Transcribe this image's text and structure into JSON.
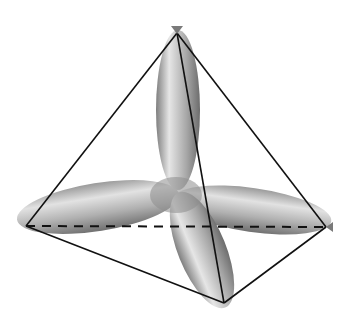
{
  "diagram": {
    "width": 338,
    "height": 325,
    "background": "#ffffff",
    "center": [
      178,
      192
    ],
    "vertices": {
      "top": [
        177,
        33
      ],
      "left": [
        26,
        226
      ],
      "right": [
        326,
        227
      ],
      "bottom": [
        224,
        303
      ]
    },
    "edges": [
      {
        "from": "top",
        "to": "left",
        "style": "solid"
      },
      {
        "from": "top",
        "to": "right",
        "style": "solid"
      },
      {
        "from": "top",
        "to": "bottom",
        "style": "solid"
      },
      {
        "from": "left",
        "to": "bottom",
        "style": "solid"
      },
      {
        "from": "right",
        "to": "bottom",
        "style": "solid"
      },
      {
        "from": "left",
        "to": "right",
        "style": "dashed"
      }
    ],
    "lobes": [
      {
        "name": "lobe-top",
        "toward": "top"
      },
      {
        "name": "lobe-left",
        "toward": "left"
      },
      {
        "name": "lobe-right",
        "toward": "right"
      },
      {
        "name": "lobe-bottom",
        "toward": "bottom"
      }
    ],
    "colors": {
      "edge": "#111111",
      "lobe_light": "#e4e4e4",
      "lobe_mid": "#a8a8a8",
      "lobe_dark": "#6e6e6e",
      "arrowhead": "#7a7a7a"
    }
  }
}
